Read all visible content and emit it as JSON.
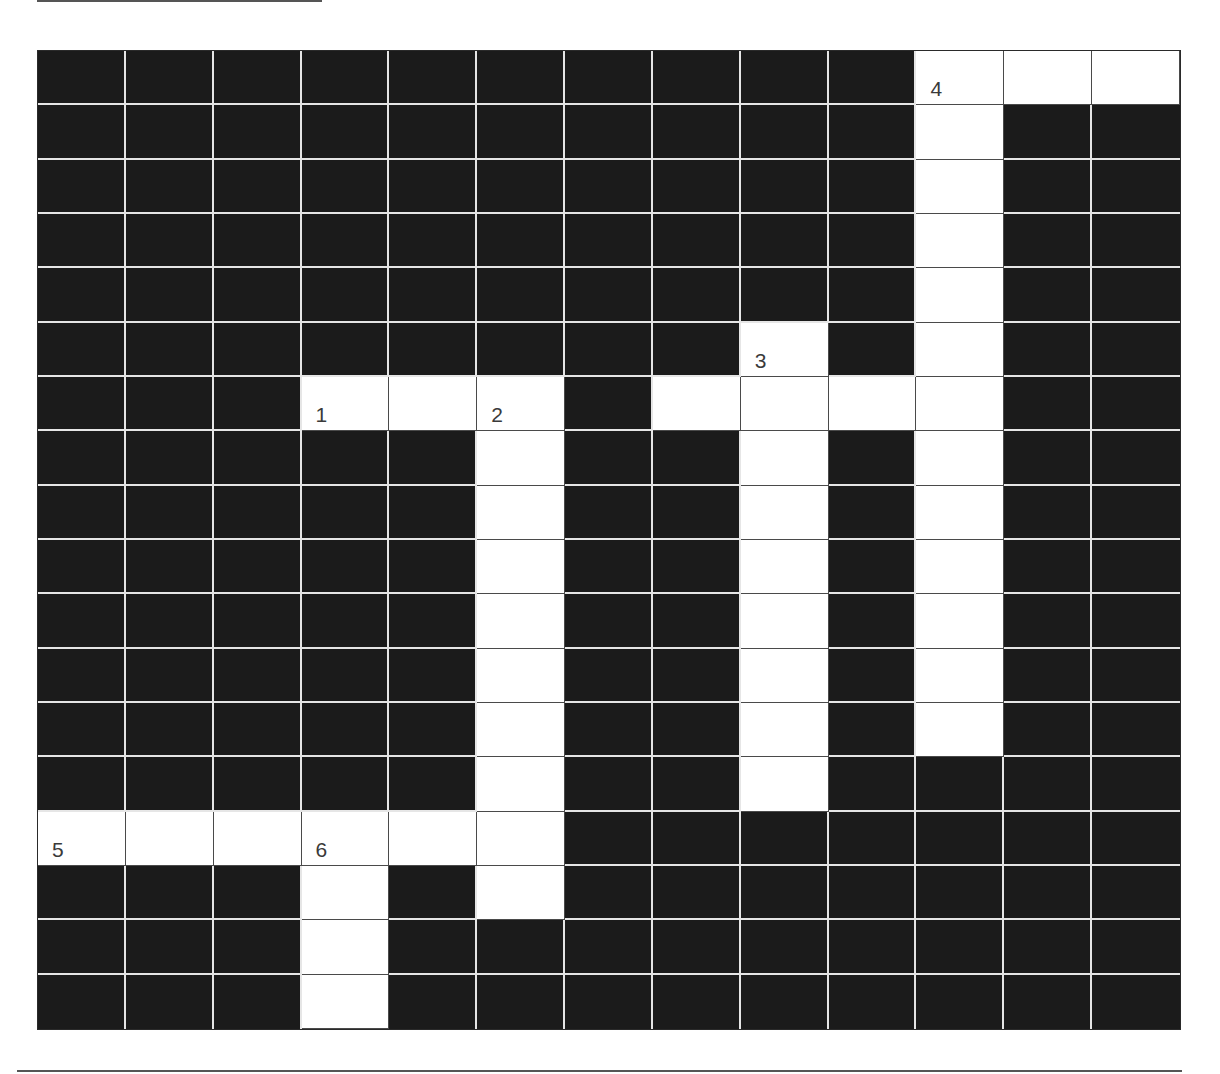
{
  "puzzle": {
    "type": "crossword",
    "rows": 18,
    "cols": 13,
    "colors": {
      "block": "#1b1b1b",
      "open": "#ffffff",
      "grid_line": "#e6e6e6",
      "number": "#3a3a3a"
    },
    "white_cells": [
      [
        0,
        10
      ],
      [
        0,
        11
      ],
      [
        0,
        12
      ],
      [
        1,
        10
      ],
      [
        2,
        10
      ],
      [
        3,
        10
      ],
      [
        4,
        10
      ],
      [
        5,
        10
      ],
      [
        5,
        8
      ],
      [
        6,
        3
      ],
      [
        6,
        4
      ],
      [
        6,
        5
      ],
      [
        6,
        7
      ],
      [
        6,
        8
      ],
      [
        6,
        9
      ],
      [
        6,
        10
      ],
      [
        7,
        5
      ],
      [
        7,
        8
      ],
      [
        7,
        10
      ],
      [
        8,
        5
      ],
      [
        8,
        8
      ],
      [
        8,
        10
      ],
      [
        9,
        5
      ],
      [
        9,
        8
      ],
      [
        9,
        10
      ],
      [
        10,
        5
      ],
      [
        10,
        8
      ],
      [
        10,
        10
      ],
      [
        11,
        5
      ],
      [
        11,
        8
      ],
      [
        11,
        10
      ],
      [
        12,
        5
      ],
      [
        12,
        8
      ],
      [
        12,
        10
      ],
      [
        13,
        5
      ],
      [
        13,
        8
      ],
      [
        14,
        0
      ],
      [
        14,
        1
      ],
      [
        14,
        2
      ],
      [
        14,
        3
      ],
      [
        14,
        4
      ],
      [
        14,
        5
      ],
      [
        15,
        3
      ],
      [
        15,
        5
      ],
      [
        16,
        3
      ],
      [
        17,
        3
      ]
    ],
    "numbers": [
      {
        "row": 0,
        "col": 10,
        "label": "4"
      },
      {
        "row": 5,
        "col": 8,
        "label": "3"
      },
      {
        "row": 6,
        "col": 3,
        "label": "1"
      },
      {
        "row": 6,
        "col": 5,
        "label": "2"
      },
      {
        "row": 14,
        "col": 0,
        "label": "5"
      },
      {
        "row": 14,
        "col": 3,
        "label": "6"
      }
    ],
    "entries": [
      {
        "number": "1",
        "direction": "across",
        "row": 6,
        "col": 3,
        "length": 3
      },
      {
        "number": "2",
        "direction": "down",
        "row": 6,
        "col": 5,
        "length": 10
      },
      {
        "number": "3",
        "direction": "down",
        "row": 5,
        "col": 8,
        "length": 9
      },
      {
        "number": "4",
        "direction": "across",
        "row": 0,
        "col": 10,
        "length": 3
      },
      {
        "number": "4",
        "direction": "down",
        "row": 0,
        "col": 10,
        "length": 13
      },
      {
        "number": "5",
        "direction": "across",
        "row": 14,
        "col": 0,
        "length": 6
      },
      {
        "number": "6",
        "direction": "down",
        "row": 14,
        "col": 3,
        "length": 4
      }
    ]
  }
}
